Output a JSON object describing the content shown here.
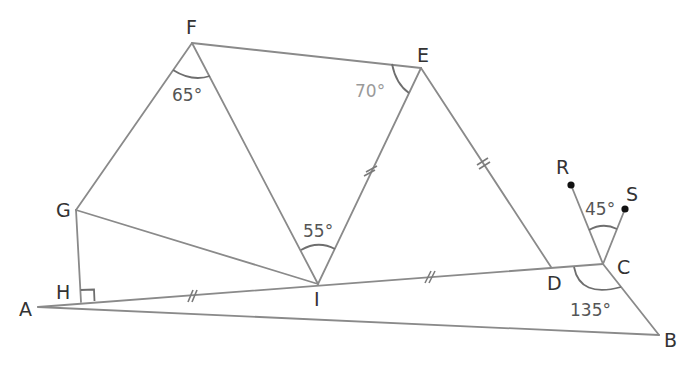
{
  "diagram": {
    "type": "geometry-figure",
    "colors": {
      "line": "#8a8a8a",
      "label": "#333333",
      "angle_label": "#555555",
      "angle_label_light": "#9a9a9a",
      "dot": "#111111"
    },
    "points": {
      "A": {
        "label": "A",
        "x": 38,
        "y": 307
      },
      "B": {
        "label": "B",
        "x": 659,
        "y": 335
      },
      "C": {
        "label": "C",
        "x": 603,
        "y": 264
      },
      "D": {
        "label": "D",
        "x": 551,
        "y": 267
      },
      "E": {
        "label": "E",
        "x": 421,
        "y": 68
      },
      "F": {
        "label": "F",
        "x": 192,
        "y": 43
      },
      "G": {
        "label": "G",
        "x": 76,
        "y": 210
      },
      "H": {
        "label": "H",
        "x": 81,
        "y": 302
      },
      "I": {
        "label": "I",
        "x": 318,
        "y": 284
      },
      "R": {
        "label": "R",
        "x": 571,
        "y": 185
      },
      "S": {
        "label": "S",
        "x": 625,
        "y": 209
      }
    },
    "segments": [
      "AC",
      "AB",
      "BC",
      "GH",
      "GF",
      "GI",
      "FI",
      "FE",
      "EI",
      "ED",
      "CR",
      "CS"
    ],
    "angles": {
      "GFI": {
        "label": "65°",
        "value": 65
      },
      "FEI": {
        "label": "70°",
        "value": 70
      },
      "FIE": {
        "label": "55°",
        "value": 55
      },
      "RCS": {
        "label": "45°",
        "value": 45
      },
      "DCB": {
        "label": "135°",
        "value": 135
      },
      "GHA": {
        "label": "right-angle",
        "value": 90
      }
    },
    "equal_marks": [
      "AI",
      "ID",
      "IE",
      "ED"
    ],
    "marked_points": [
      "R",
      "S"
    ]
  }
}
